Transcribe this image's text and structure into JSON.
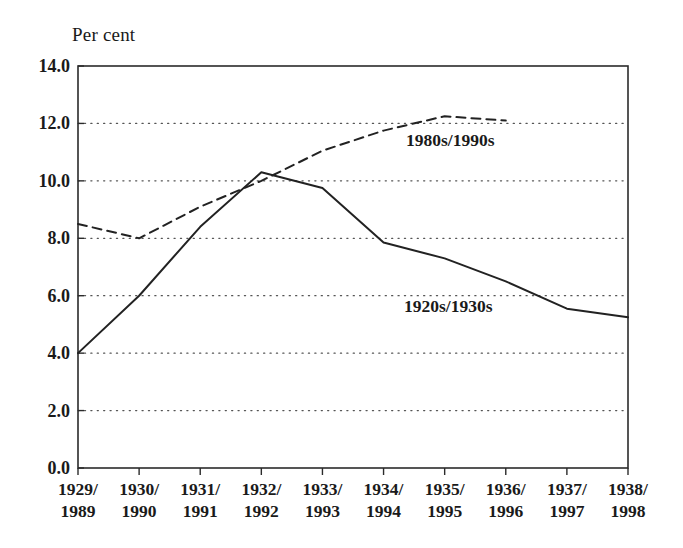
{
  "chart_data": {
    "type": "line",
    "title": "",
    "subtitle": "",
    "ylabel": "Per cent",
    "xlabel": "",
    "ylim": [
      0.0,
      14.0
    ],
    "yticks": [
      "0.0",
      "2.0",
      "4.0",
      "6.0",
      "8.0",
      "10.0",
      "12.0",
      "14.0"
    ],
    "ytick_values": [
      0.0,
      2.0,
      4.0,
      6.0,
      8.0,
      10.0,
      12.0,
      14.0
    ],
    "grid": "horizontal-dotted",
    "legend_position": "inline-annotations",
    "categories": [
      {
        "top": "1929/",
        "bottom": "1989"
      },
      {
        "top": "1930/",
        "bottom": "1990"
      },
      {
        "top": "1931/",
        "bottom": "1991"
      },
      {
        "top": "1932/",
        "bottom": "1992"
      },
      {
        "top": "1933/",
        "bottom": "1993"
      },
      {
        "top": "1934/",
        "bottom": "1994"
      },
      {
        "top": "1935/",
        "bottom": "1995"
      },
      {
        "top": "1936/",
        "bottom": "1996"
      },
      {
        "top": "1937/",
        "bottom": "1997"
      },
      {
        "top": "1938/",
        "bottom": "1998"
      }
    ],
    "series": [
      {
        "name": "1920s/1930s",
        "style": "solid",
        "color": "#222222",
        "values": [
          4.0,
          6.0,
          8.4,
          10.3,
          9.75,
          7.85,
          7.3,
          6.5,
          5.55,
          5.25
        ]
      },
      {
        "name": "1980s/1990s",
        "style": "dashed",
        "color": "#222222",
        "values": [
          8.5,
          8.0,
          9.1,
          10.0,
          11.05,
          11.75,
          12.25,
          12.1,
          null,
          null
        ]
      }
    ],
    "annotations": [
      {
        "text": "1980s/1990s",
        "series": "1980s/1990s"
      },
      {
        "text": "1920s/1930s",
        "series": "1920s/1930s"
      }
    ]
  }
}
